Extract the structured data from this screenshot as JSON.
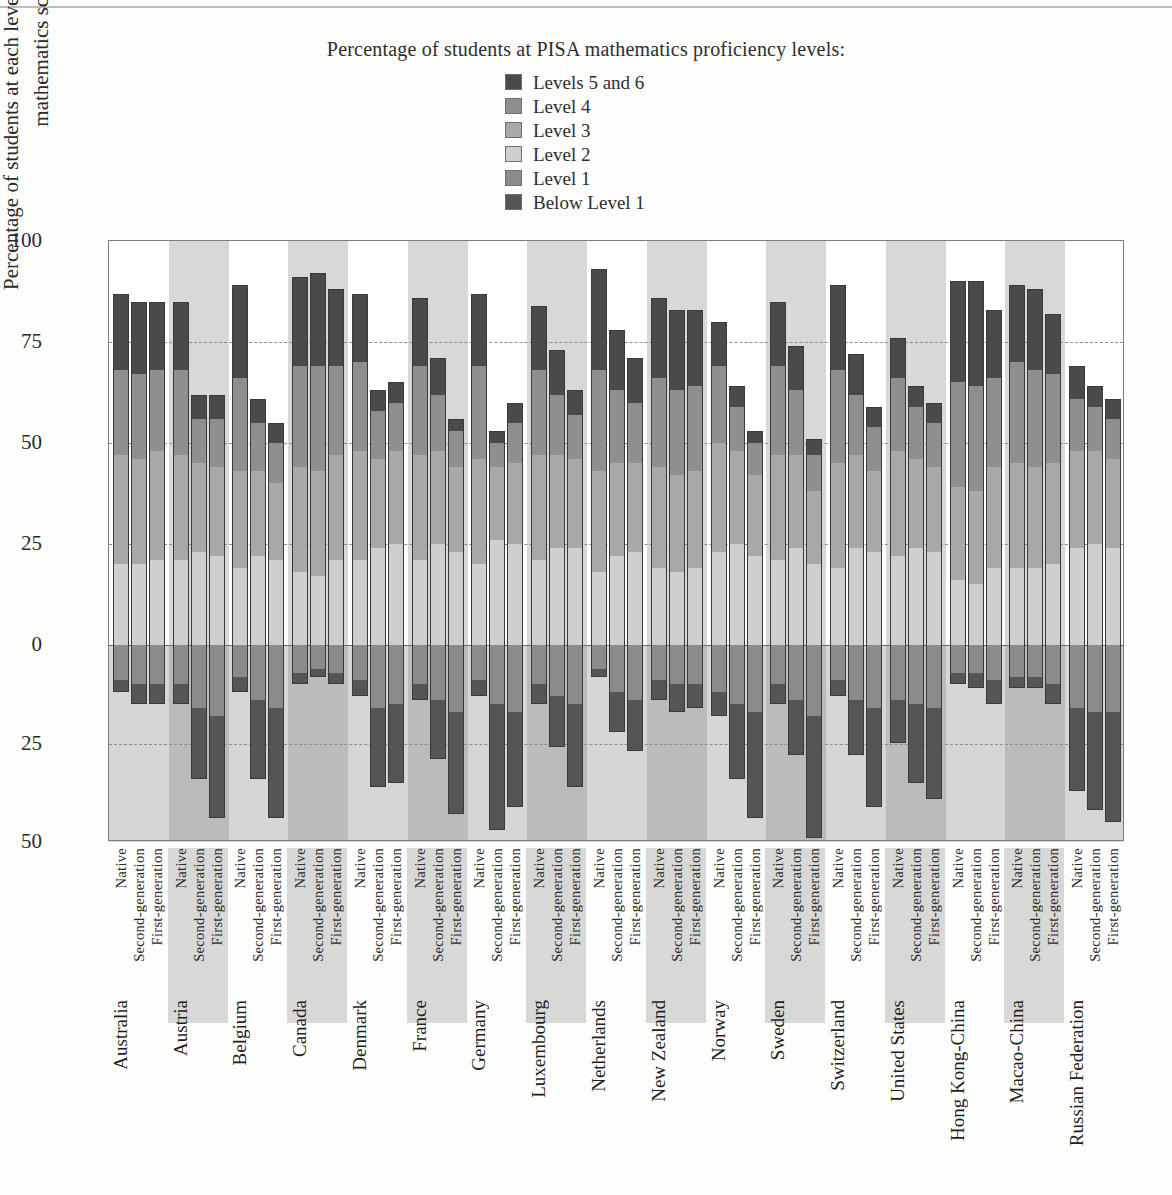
{
  "legend": {
    "title": "Percentage of students at PISA mathematics proficiency levels:",
    "items": [
      {
        "label": "Levels 5 and 6",
        "color": "#4a4a4a"
      },
      {
        "label": "Level 4",
        "color": "#8f8f8f"
      },
      {
        "label": "Level 3",
        "color": "#a8a8a8"
      },
      {
        "label": "Level 2",
        "color": "#cfcfcf"
      },
      {
        "label": "Level 1",
        "color": "#8b8b8b"
      },
      {
        "label": "Below Level 1",
        "color": "#555555"
      }
    ]
  },
  "axes": {
    "ylabel": "Percentage of students at each level of proficiency on the mathematics scale",
    "yticks_top": [
      "100",
      "75",
      "50",
      "25",
      "0"
    ],
    "yticks_bottom": [
      "25",
      "50"
    ],
    "ymax_positive": 100,
    "ymax_negative": 50,
    "groups_per_country": [
      "Native",
      "Second-generation",
      "First-generation"
    ]
  },
  "chart_data": {
    "type": "bar",
    "subtype": "diverging-stacked",
    "title": "Percentage of students at PISA mathematics proficiency levels:",
    "xlabel": "",
    "ylabel": "Percentage of students at each level of proficiency on the mathematics scale",
    "ylim": [
      -50,
      100
    ],
    "grid": true,
    "legend_position": "top-center",
    "positive_levels": [
      "Level 2",
      "Level 3",
      "Level 4",
      "Levels 5 and 6"
    ],
    "negative_levels": [
      "Level 1",
      "Below Level 1"
    ],
    "categories": [
      "Native",
      "Second-generation",
      "First-generation"
    ],
    "countries": [
      "Australia",
      "Austria",
      "Belgium",
      "Canada",
      "Denmark",
      "France",
      "Germany",
      "Luxembourg",
      "Netherlands",
      "New Zealand",
      "Norway",
      "Sweden",
      "Switzerland",
      "United States",
      "Hong Kong-China",
      "Macao-China",
      "Russian Federation"
    ],
    "series": [
      {
        "country": "Australia",
        "bars": [
          {
            "group": "Native",
            "l2": 20,
            "l3": 27,
            "l4": 21,
            "l56": 19,
            "l1": 9,
            "below": 3
          },
          {
            "group": "Second-generation",
            "l2": 20,
            "l3": 26,
            "l4": 21,
            "l56": 18,
            "l1": 10,
            "below": 5
          },
          {
            "group": "First-generation",
            "l2": 21,
            "l3": 27,
            "l4": 20,
            "l56": 17,
            "l1": 10,
            "below": 5
          }
        ]
      },
      {
        "country": "Austria",
        "bars": [
          {
            "group": "Native",
            "l2": 21,
            "l3": 26,
            "l4": 21,
            "l56": 17,
            "l1": 10,
            "below": 5
          },
          {
            "group": "Second-generation",
            "l2": 23,
            "l3": 22,
            "l4": 11,
            "l56": 6,
            "l1": 16,
            "below": 18
          },
          {
            "group": "First-generation",
            "l2": 22,
            "l3": 22,
            "l4": 12,
            "l56": 6,
            "l1": 18,
            "below": 26
          }
        ]
      },
      {
        "country": "Belgium",
        "bars": [
          {
            "group": "Native",
            "l2": 19,
            "l3": 24,
            "l4": 23,
            "l56": 23,
            "l1": 8,
            "below": 4
          },
          {
            "group": "Second-generation",
            "l2": 22,
            "l3": 21,
            "l4": 12,
            "l56": 6,
            "l1": 14,
            "below": 20
          },
          {
            "group": "First-generation",
            "l2": 21,
            "l3": 19,
            "l4": 10,
            "l56": 5,
            "l1": 16,
            "below": 28
          }
        ]
      },
      {
        "country": "Canada",
        "bars": [
          {
            "group": "Native",
            "l2": 18,
            "l3": 26,
            "l4": 25,
            "l56": 22,
            "l1": 7,
            "below": 3
          },
          {
            "group": "Second-generation",
            "l2": 17,
            "l3": 26,
            "l4": 26,
            "l56": 23,
            "l1": 6,
            "below": 2
          },
          {
            "group": "First-generation",
            "l2": 21,
            "l3": 26,
            "l4": 22,
            "l56": 19,
            "l1": 7,
            "below": 3
          }
        ]
      },
      {
        "country": "Denmark",
        "bars": [
          {
            "group": "Native",
            "l2": 21,
            "l3": 27,
            "l4": 22,
            "l56": 17,
            "l1": 9,
            "below": 4
          },
          {
            "group": "Second-generation",
            "l2": 24,
            "l3": 22,
            "l4": 12,
            "l56": 5,
            "l1": 16,
            "below": 20
          },
          {
            "group": "First-generation",
            "l2": 25,
            "l3": 23,
            "l4": 12,
            "l56": 5,
            "l1": 15,
            "below": 20
          }
        ]
      },
      {
        "country": "France",
        "bars": [
          {
            "group": "Native",
            "l2": 21,
            "l3": 26,
            "l4": 22,
            "l56": 17,
            "l1": 10,
            "below": 4
          },
          {
            "group": "Second-generation",
            "l2": 25,
            "l3": 23,
            "l4": 14,
            "l56": 9,
            "l1": 14,
            "below": 15
          },
          {
            "group": "First-generation",
            "l2": 23,
            "l3": 21,
            "l4": 9,
            "l56": 3,
            "l1": 17,
            "below": 26
          }
        ]
      },
      {
        "country": "Germany",
        "bars": [
          {
            "group": "Native",
            "l2": 20,
            "l3": 26,
            "l4": 23,
            "l56": 18,
            "l1": 9,
            "below": 4
          },
          {
            "group": "Second-generation",
            "l2": 26,
            "l3": 18,
            "l4": 6,
            "l56": 3,
            "l1": 15,
            "below": 32
          },
          {
            "group": "First-generation",
            "l2": 25,
            "l3": 20,
            "l4": 10,
            "l56": 5,
            "l1": 17,
            "below": 24
          }
        ]
      },
      {
        "country": "Luxembourg",
        "bars": [
          {
            "group": "Native",
            "l2": 21,
            "l3": 26,
            "l4": 21,
            "l56": 16,
            "l1": 10,
            "below": 5
          },
          {
            "group": "Second-generation",
            "l2": 24,
            "l3": 23,
            "l4": 15,
            "l56": 11,
            "l1": 13,
            "below": 13
          },
          {
            "group": "First-generation",
            "l2": 24,
            "l3": 22,
            "l4": 11,
            "l56": 6,
            "l1": 15,
            "below": 21
          }
        ]
      },
      {
        "country": "Netherlands",
        "bars": [
          {
            "group": "Native",
            "l2": 18,
            "l3": 25,
            "l4": 25,
            "l56": 25,
            "l1": 6,
            "below": 2
          },
          {
            "group": "Second-generation",
            "l2": 22,
            "l3": 23,
            "l4": 18,
            "l56": 15,
            "l1": 12,
            "below": 10
          },
          {
            "group": "First-generation",
            "l2": 23,
            "l3": 22,
            "l4": 15,
            "l56": 11,
            "l1": 14,
            "below": 13
          }
        ]
      },
      {
        "country": "New Zealand",
        "bars": [
          {
            "group": "Native",
            "l2": 19,
            "l3": 25,
            "l4": 22,
            "l56": 20,
            "l1": 9,
            "below": 5
          },
          {
            "group": "Second-generation",
            "l2": 18,
            "l3": 24,
            "l4": 21,
            "l56": 20,
            "l1": 10,
            "below": 7
          },
          {
            "group": "First-generation",
            "l2": 19,
            "l3": 24,
            "l4": 21,
            "l56": 19,
            "l1": 10,
            "below": 6
          }
        ]
      },
      {
        "country": "Norway",
        "bars": [
          {
            "group": "Native",
            "l2": 23,
            "l3": 27,
            "l4": 19,
            "l56": 11,
            "l1": 12,
            "below": 6
          },
          {
            "group": "Second-generation",
            "l2": 25,
            "l3": 23,
            "l4": 11,
            "l56": 5,
            "l1": 15,
            "below": 19
          },
          {
            "group": "First-generation",
            "l2": 22,
            "l3": 20,
            "l4": 8,
            "l56": 3,
            "l1": 17,
            "below": 27
          }
        ]
      },
      {
        "country": "Sweden",
        "bars": [
          {
            "group": "Native",
            "l2": 21,
            "l3": 26,
            "l4": 22,
            "l56": 16,
            "l1": 10,
            "below": 5
          },
          {
            "group": "Second-generation",
            "l2": 24,
            "l3": 23,
            "l4": 16,
            "l56": 11,
            "l1": 14,
            "below": 14
          },
          {
            "group": "First-generation",
            "l2": 20,
            "l3": 18,
            "l4": 9,
            "l56": 4,
            "l1": 18,
            "below": 31
          }
        ]
      },
      {
        "country": "Switzerland",
        "bars": [
          {
            "group": "Native",
            "l2": 19,
            "l3": 26,
            "l4": 23,
            "l56": 21,
            "l1": 9,
            "below": 4
          },
          {
            "group": "Second-generation",
            "l2": 24,
            "l3": 23,
            "l4": 15,
            "l56": 10,
            "l1": 14,
            "below": 14
          },
          {
            "group": "First-generation",
            "l2": 23,
            "l3": 20,
            "l4": 11,
            "l56": 5,
            "l1": 16,
            "below": 25
          }
        ]
      },
      {
        "country": "United States",
        "bars": [
          {
            "group": "Native",
            "l2": 22,
            "l3": 26,
            "l4": 18,
            "l56": 10,
            "l1": 14,
            "below": 11
          },
          {
            "group": "Second-generation",
            "l2": 24,
            "l3": 22,
            "l4": 13,
            "l56": 5,
            "l1": 15,
            "below": 20
          },
          {
            "group": "First-generation",
            "l2": 23,
            "l3": 21,
            "l4": 11,
            "l56": 5,
            "l1": 16,
            "below": 23
          }
        ]
      },
      {
        "country": "Hong Kong-China",
        "bars": [
          {
            "group": "Native",
            "l2": 16,
            "l3": 23,
            "l4": 26,
            "l56": 25,
            "l1": 7,
            "below": 3
          },
          {
            "group": "Second-generation",
            "l2": 15,
            "l3": 23,
            "l4": 26,
            "l56": 26,
            "l1": 7,
            "below": 4
          },
          {
            "group": "First-generation",
            "l2": 19,
            "l3": 25,
            "l4": 22,
            "l56": 17,
            "l1": 9,
            "below": 6
          }
        ]
      },
      {
        "country": "Macao-China",
        "bars": [
          {
            "group": "Native",
            "l2": 19,
            "l3": 26,
            "l4": 25,
            "l56": 19,
            "l1": 8,
            "below": 3
          },
          {
            "group": "Second-generation",
            "l2": 19,
            "l3": 25,
            "l4": 24,
            "l56": 20,
            "l1": 8,
            "below": 3
          },
          {
            "group": "First-generation",
            "l2": 20,
            "l3": 25,
            "l4": 22,
            "l56": 15,
            "l1": 10,
            "below": 5
          }
        ]
      },
      {
        "country": "Russian Federation",
        "bars": [
          {
            "group": "Native",
            "l2": 24,
            "l3": 24,
            "l4": 13,
            "l56": 8,
            "l1": 16,
            "below": 21
          },
          {
            "group": "Second-generation",
            "l2": 25,
            "l3": 23,
            "l4": 11,
            "l56": 5,
            "l1": 17,
            "below": 25
          },
          {
            "group": "First-generation",
            "l2": 24,
            "l3": 22,
            "l4": 10,
            "l56": 5,
            "l1": 17,
            "below": 28
          }
        ]
      }
    ]
  }
}
